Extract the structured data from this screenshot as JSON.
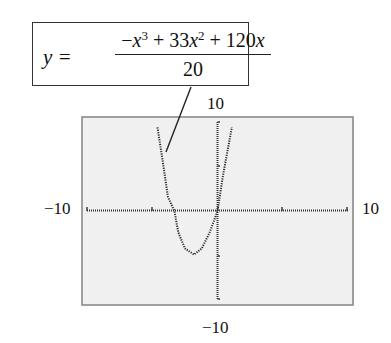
{
  "equation": {
    "lhs": "y =",
    "numerator_parts": [
      "−",
      "x",
      "3",
      " + 33",
      "x",
      "2",
      " + 120",
      "x"
    ],
    "denominator": "20"
  },
  "labels": {
    "ymax": "10",
    "ymin": "−10",
    "xmin": "−10",
    "xmax": "10"
  },
  "chart_data": {
    "type": "line",
    "xlabel": "",
    "ylabel": "",
    "xlim": [
      -10,
      10
    ],
    "ylim": [
      -10,
      10
    ],
    "grid": false,
    "style": "graphing-calculator dotted plot",
    "note": "Curve points traced from the plotted dots (approximate); they do not match the printed formula.",
    "series": [
      {
        "name": "observed curve",
        "x": [
          -4.6,
          -4.2,
          -3.8,
          -3.3,
          -3.0,
          -2.5,
          -1.8,
          -1.2,
          -0.6,
          0,
          0.4,
          0.8,
          1.1
        ],
        "y": [
          9.4,
          5.6,
          1.6,
          0,
          -2.4,
          -4.2,
          -4.9,
          -4.2,
          -2.4,
          0,
          3.8,
          7.0,
          9.4
        ]
      }
    ]
  }
}
